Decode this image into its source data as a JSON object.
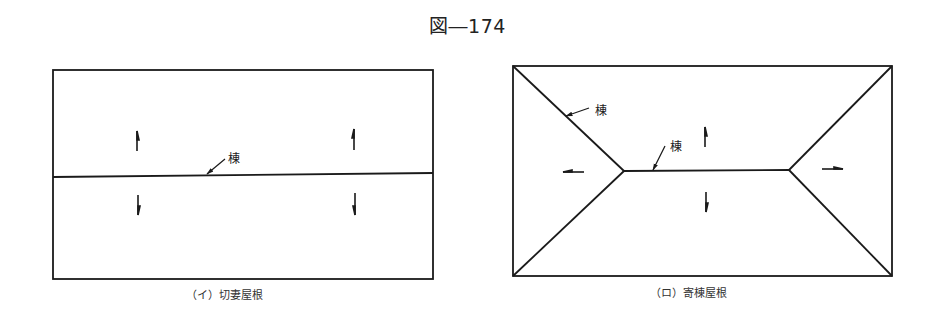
{
  "figure": {
    "title": "図―174",
    "stroke_color": "#1a1a1a"
  },
  "diagrams": [
    {
      "id": "gable",
      "caption": "（イ）切妻屋根",
      "ridge_label": "棟"
    },
    {
      "id": "hip",
      "caption": "（ロ）寄棟屋根",
      "ridge_labels": [
        "棟",
        "棟"
      ]
    }
  ]
}
